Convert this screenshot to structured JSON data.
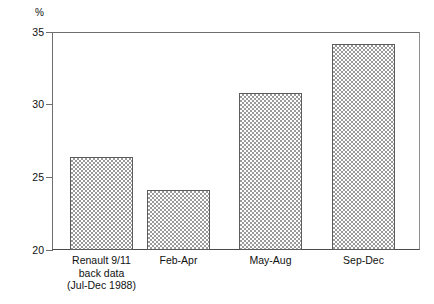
{
  "chart_data": {
    "type": "bar",
    "title": "",
    "subtitle": "",
    "xlabel": "",
    "ylabel": "%",
    "categories": [
      "Renault 9/11\nback data\n(Jul-Dec 1988)",
      "Feb-Apr",
      "May-Aug",
      "Sep-Dec"
    ],
    "values": [
      26.4,
      24.1,
      30.8,
      34.2
    ],
    "ylim": [
      20,
      35
    ],
    "yticks": [
      20,
      25,
      30,
      35
    ],
    "ytick_labels": [
      "20",
      "25",
      "30",
      "35"
    ],
    "grid": false,
    "legend": null,
    "bar_fill": "checkerboard-hatch",
    "bar_fill_color": "#9a9a9a",
    "bar_edge_color": "#5c5c5c",
    "axis_color": "#6e6e6e",
    "background": "#ffffff"
  },
  "axis": {
    "unit_caption": "%",
    "ticks": [
      {
        "label": "35",
        "value": 35
      },
      {
        "label": "30",
        "value": 30
      },
      {
        "label": "25",
        "value": 25
      },
      {
        "label": "20",
        "value": 20
      }
    ]
  },
  "categories": [
    {
      "line1": "Renault 9/11",
      "line2": "back data",
      "line3": "(Jul-Dec 1988)"
    },
    {
      "line1": "Feb-Apr",
      "line2": "",
      "line3": ""
    },
    {
      "line1": "May-Aug",
      "line2": "",
      "line3": ""
    },
    {
      "line1": "Sep-Dec",
      "line2": "",
      "line3": ""
    }
  ]
}
